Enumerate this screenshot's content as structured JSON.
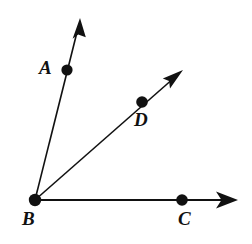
{
  "figure": {
    "type": "geometry-diagram",
    "background_color": "#ffffff",
    "stroke_color": "#111111",
    "dot_color": "#111111",
    "stroke_width": 1.6,
    "dot_radius": 5.6,
    "canvas": {
      "width": 252,
      "height": 244
    },
    "vertex": {
      "name": "B",
      "x": 35,
      "y": 200
    },
    "labels": [
      {
        "id": "A",
        "text": "A",
        "x": 39,
        "y": 58
      },
      {
        "id": "B",
        "text": "B",
        "x": 22,
        "y": 209
      },
      {
        "id": "C",
        "text": "C",
        "x": 178,
        "y": 209
      },
      {
        "id": "D",
        "text": "D",
        "x": 134,
        "y": 110
      }
    ],
    "points": [
      {
        "name": "A",
        "x": 67,
        "y": 70
      },
      {
        "name": "B",
        "x": 35,
        "y": 200
      },
      {
        "name": "C",
        "x": 182,
        "y": 200
      },
      {
        "name": "D",
        "x": 142,
        "y": 102
      }
    ],
    "rays": [
      {
        "name": "ray-BA",
        "from": "B",
        "through": "A",
        "start": {
          "x": 35,
          "y": 200
        },
        "end": {
          "x": 80,
          "y": 20
        },
        "arrowhead": "end"
      },
      {
        "name": "ray-BD",
        "from": "B",
        "through": "D",
        "start": {
          "x": 35,
          "y": 200
        },
        "end": {
          "x": 182,
          "y": 71
        },
        "arrowhead": "end"
      },
      {
        "name": "ray-BC",
        "from": "B",
        "through": "C",
        "start": {
          "x": 35,
          "y": 200
        },
        "end": {
          "x": 237,
          "y": 200
        },
        "arrowhead": "end"
      }
    ]
  }
}
